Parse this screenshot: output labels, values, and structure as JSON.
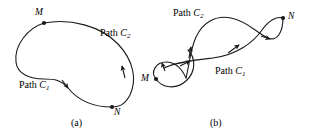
{
  "figure": {
    "caption_a": "(a)",
    "caption_b": "(b)",
    "stroke_color": "#1a1a1a",
    "background_color": "#ffffff"
  },
  "panel_a": {
    "point_m_label": "M",
    "point_n_label": "N",
    "path_c2_word": "Path",
    "path_c2_symbol": "C",
    "path_c2_subscript": "2",
    "path_c1_word": "Path",
    "path_c1_symbol": "C",
    "path_c1_subscript": "1"
  },
  "panel_b": {
    "point_m_label": "M",
    "point_n_label": "N",
    "path_c2_word": "Path",
    "path_c2_symbol": "C",
    "path_c2_subscript": "2",
    "path_c1_word": "Path",
    "path_c1_symbol": "C",
    "path_c1_subscript": "1"
  }
}
